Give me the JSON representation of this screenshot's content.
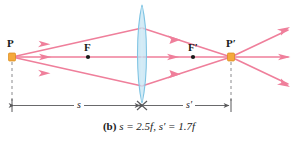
{
  "figure": {
    "type": "optics-ray-diagram",
    "caption": {
      "tag": "(b)",
      "equations": "s = 2.5f,  s′ = 1.7f",
      "full": "(b) s = 2.5f, s′ = 1.7f"
    },
    "labels": {
      "object_point": "P",
      "image_point": "P′",
      "front_focal_point": "F",
      "back_focal_point": "F′",
      "object_distance": "s",
      "image_distance": "s′"
    },
    "colors": {
      "ray": "#ef7f9b",
      "ray_dark": "#e2648a",
      "lens_fill": "#bfe2f2",
      "lens_stroke": "#7fc4e3",
      "point_marker": "#f5a93c",
      "point_marker_stroke": "#d98a1a",
      "focal_dot": "#1a1a1a",
      "dimension_line": "#58585a",
      "dashed_line": "#8a8a8d",
      "text": "#1a1a1a",
      "background": "#ffffff"
    },
    "geometry": {
      "axis_y": 57,
      "lens_center_x": 142,
      "lens_top_y": 5,
      "lens_bottom_y": 103,
      "object_x": 12,
      "image_x": 231,
      "focal_front_x": 88,
      "focal_back_x": 193,
      "dimension_y": 105,
      "object_distance_label_x": 77,
      "image_distance_label_x": 187
    }
  }
}
